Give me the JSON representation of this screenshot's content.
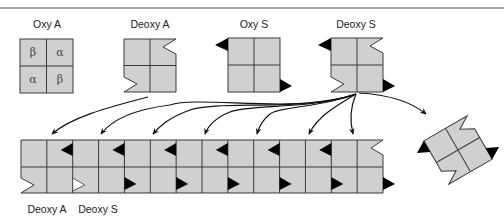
{
  "figure": {
    "colors": {
      "cell_fill": "#d0d0d0",
      "cell_stroke": "#3a3a3a",
      "sticky_patch": "#000000",
      "wt_patch_fill": "#ffffff",
      "arrow": "#111111",
      "rule": "#555555"
    },
    "tetramers": [
      {
        "id": "oxy-a",
        "label": "Oxy A",
        "subunits": [
          "β",
          "α",
          "α",
          "β"
        ],
        "notches": false,
        "sticky_patches": false
      },
      {
        "id": "deoxy-a",
        "label": "Deoxy A",
        "subunits": [],
        "notches": true,
        "sticky_patches": false
      },
      {
        "id": "oxy-s",
        "label": "Oxy S",
        "subunits": [],
        "notches": false,
        "sticky_patches": true
      },
      {
        "id": "deoxy-s",
        "label": "Deoxy S",
        "subunits": [],
        "notches": true,
        "sticky_patches": true
      }
    ],
    "fiber": {
      "columns": 14,
      "labels": [
        "Deoxy A",
        "Deoxy S"
      ],
      "incorporated": [
        "deoxy-a",
        "deoxy-s",
        "deoxy-s",
        "deoxy-s",
        "deoxy-s",
        "deoxy-s",
        "deoxy-s"
      ]
    },
    "arrows": {
      "from_deoxy_a": 1,
      "from_deoxy_s": 7
    }
  }
}
